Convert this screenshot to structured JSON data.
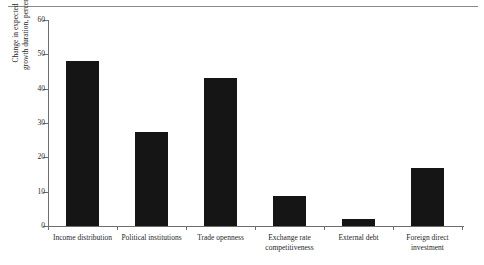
{
  "chart_data": {
    "type": "bar",
    "title": "",
    "subtitle": "",
    "xlabel": "",
    "ylabel_lines": [
      "Change in expected",
      "growth duration, percent"
    ],
    "ylabel": "Change in expected growth duration, percent",
    "ylim": [
      0,
      60
    ],
    "ytick_values": [
      0,
      10,
      20,
      30,
      40,
      50,
      60
    ],
    "ytick_labels": [
      "0",
      "10",
      "20",
      "30",
      "40",
      "50",
      "60"
    ],
    "grid": false,
    "legend": "none",
    "bar_color": "#151515",
    "axis_color": "#6e6e6e",
    "categories": [
      "Income distribution",
      "Political institutions",
      "Trade openness",
      "Exchange rate competitiveness",
      "External debt",
      "Foreign direct investment"
    ],
    "category_label_lines": [
      [
        "Income distribution"
      ],
      [
        "Political institutions"
      ],
      [
        "Trade openness"
      ],
      [
        "Exchange rate",
        "competitiveness"
      ],
      [
        "External debt"
      ],
      [
        "Foreign direct",
        "investment"
      ]
    ],
    "values": [
      48,
      27.5,
      43,
      8.7,
      2,
      17
    ]
  },
  "figure": {
    "top_rule": true
  }
}
